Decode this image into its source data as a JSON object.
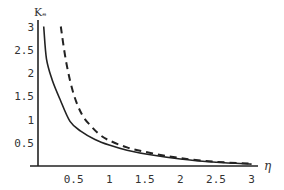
{
  "chart_data": {
    "type": "line",
    "title": "",
    "xlabel": "η",
    "ylabel": "Kₑ",
    "xlim": [
      0,
      3
    ],
    "ylim": [
      0,
      3
    ],
    "grid": false,
    "legend": null,
    "x_ticks": [
      "0.5",
      "1",
      "1.5",
      "2",
      "2.5",
      "3"
    ],
    "y_ticks": [
      "0.5",
      "1",
      "1.5",
      "2",
      "2.5",
      "3"
    ],
    "series": [
      {
        "name": "solid",
        "style": "solid",
        "x": [
          0.08,
          0.12,
          0.2,
          0.31,
          0.45,
          0.6,
          0.8,
          1.0,
          1.25,
          1.58,
          2.0,
          2.5,
          3.0
        ],
        "y": [
          3.0,
          2.3,
          1.85,
          1.43,
          0.96,
          0.75,
          0.57,
          0.45,
          0.34,
          0.24,
          0.15,
          0.08,
          0.04
        ]
      },
      {
        "name": "dashed",
        "style": "dashed",
        "x": [
          0.32,
          0.4,
          0.5,
          0.62,
          0.75,
          0.87,
          1.0,
          1.25,
          1.58,
          2.0,
          2.5,
          3.0
        ],
        "y": [
          3.0,
          2.2,
          1.55,
          1.1,
          0.85,
          0.67,
          0.55,
          0.4,
          0.28,
          0.17,
          0.09,
          0.05
        ]
      }
    ]
  }
}
